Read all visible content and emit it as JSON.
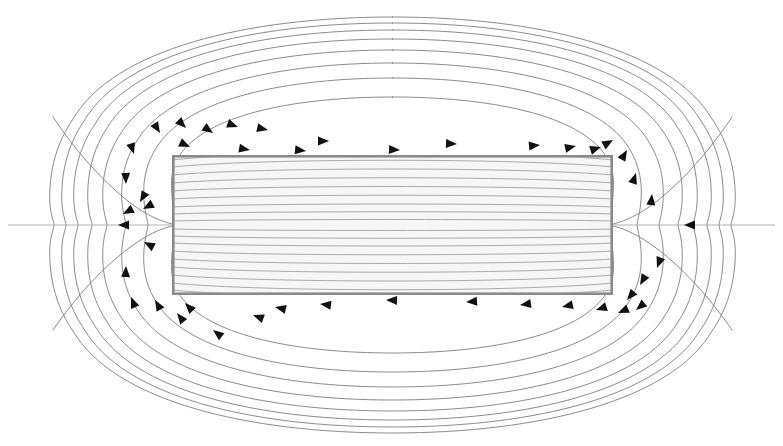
{
  "figure": {
    "description": "Cross-section of a rectangular bar magnet showing closed magnetic field lines (B-field) looping from one pole to the other, with arrowheads marking the field direction.",
    "width": 783,
    "height": 446,
    "background_color": "#ffffff"
  },
  "magnet": {
    "label": "bar-magnet",
    "shape": "rectangle",
    "x": 172,
    "y": 155,
    "width": 441,
    "height": 140,
    "fill_color": "#f4f4f4",
    "border_color": "#8a8a8a",
    "border_width": 2.6
  },
  "style": {
    "fieldline_color": "#7e7e7e",
    "fieldline_inner_color": "#9b9b9b",
    "axis_color": "#a8a8a8",
    "arrow_color": "#111111",
    "fieldline_width": 0.9
  },
  "chart_data": {
    "type": "line",
    "xlabel": "",
    "ylabel": "",
    "xlim": [
      0,
      783
    ],
    "ylim": [
      0,
      446
    ],
    "grid": false,
    "legend": "none",
    "center": {
      "x": 392.5,
      "y": 225
    },
    "magnet_bounds": {
      "left": 172,
      "right": 613,
      "top": 155,
      "bottom": 295
    },
    "annotations": [
      "Arrows above the magnet point from right to left (toward the left pole).",
      "Arrows below the magnet point from left to right (toward the right pole).",
      "Field lines inside the magnet run left-to-right, nearly horizontal.",
      "A straight horizontal axis line crosses the whole figure at the magnet mid-height."
    ],
    "series": [
      {
        "name": "external-loop-1",
        "half_width": 232,
        "half_height": 128,
        "closed": true
      },
      {
        "name": "external-loop-2",
        "half_width": 251,
        "half_height": 147,
        "closed": true
      },
      {
        "name": "external-loop-3",
        "half_width": 267,
        "half_height": 162,
        "closed": true
      },
      {
        "name": "external-loop-4",
        "half_width": 282,
        "half_height": 175,
        "closed": true
      },
      {
        "name": "external-loop-5",
        "half_width": 296,
        "half_height": 186,
        "closed": true
      },
      {
        "name": "external-loop-6",
        "half_width": 310,
        "half_height": 196,
        "closed": true
      },
      {
        "name": "external-loop-7",
        "half_width": 324,
        "half_height": 205,
        "closed": true
      },
      {
        "name": "external-loop-8",
        "half_width": 340,
        "half_height": 214,
        "closed": true
      },
      {
        "name": "open-line-upper-left",
        "closed": false
      },
      {
        "name": "open-line-lower-left",
        "closed": false
      },
      {
        "name": "open-line-upper-right",
        "closed": false
      },
      {
        "name": "open-line-lower-right",
        "closed": false
      },
      {
        "name": "axis-line",
        "closed": false
      }
    ],
    "interior_lines_count": 17,
    "external_loops_count": 8,
    "arrowhead_count": 44
  }
}
